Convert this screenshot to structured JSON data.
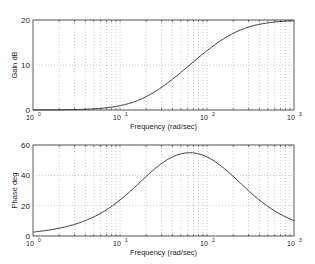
{
  "chart_data": [
    {
      "type": "line",
      "title": "",
      "xlabel": "Frequency (rad/sec)",
      "ylabel": "Gain dB",
      "xscale": "log",
      "xlim": [
        1,
        1000
      ],
      "ylim": [
        0,
        20
      ],
      "xticks": [
        "10^0",
        "10^1",
        "10^2",
        "10^3"
      ],
      "yticks": [
        0,
        10,
        20
      ],
      "grid": true,
      "x": [
        1,
        2,
        5,
        10,
        20,
        40,
        63,
        100,
        200,
        500,
        1000
      ],
      "series": [
        {
          "name": "Gain",
          "values": [
            0.02,
            0.09,
            0.48,
            1.5,
            3.7,
            7.5,
            10.0,
            12.6,
            16.3,
            19.2,
            19.8
          ]
        }
      ]
    },
    {
      "type": "line",
      "title": "",
      "xlabel": "Frequency (rad/sec)",
      "ylabel": "Phase deg",
      "xscale": "log",
      "xlim": [
        1,
        1000
      ],
      "ylim": [
        0,
        60
      ],
      "xticks": [
        "10^0",
        "10^1",
        "10^2",
        "10^3"
      ],
      "yticks": [
        0,
        20,
        40,
        60
      ],
      "grid": true,
      "x": [
        1,
        2,
        5,
        10,
        20,
        40,
        63,
        100,
        200,
        500,
        1000
      ],
      "series": [
        {
          "name": "Phase",
          "values": [
            2.6,
            5.1,
            12.6,
            23.7,
            39.3,
            52.4,
            54.9,
            52.1,
            39.3,
            22.3,
            12.8
          ]
        }
      ]
    }
  ],
  "top": {
    "ylabel": "Gain dB",
    "xlabel": "Frequency (rad/sec)",
    "yticks": [
      "0",
      "10",
      "20"
    ]
  },
  "bottom": {
    "ylabel": "Phase deg",
    "xlabel": "Frequency (rad/sec)",
    "yticks": [
      "0",
      "20",
      "40",
      "60"
    ]
  },
  "xticks": [
    "10",
    "10",
    "10",
    "10"
  ],
  "xexp": [
    "0",
    "1",
    "2",
    "3"
  ]
}
